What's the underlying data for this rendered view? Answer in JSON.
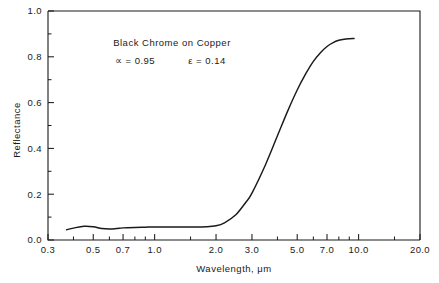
{
  "chart_data": {
    "type": "line",
    "title": "",
    "xlabel": "Wavelength, μm",
    "ylabel": "Reflectance",
    "xscale": "log",
    "yscale": "linear",
    "xlim": [
      0.3,
      20.0
    ],
    "ylim": [
      0.0,
      1.0
    ],
    "grid": false,
    "legend": "none",
    "x_ticks": [
      {
        "value": 0.3,
        "label": "0.3"
      },
      {
        "value": 0.5,
        "label": "0.5"
      },
      {
        "value": 0.7,
        "label": "0.7"
      },
      {
        "value": 1.0,
        "label": "1.0"
      },
      {
        "value": 2.0,
        "label": "2.0"
      },
      {
        "value": 3.0,
        "label": "3.0"
      },
      {
        "value": 5.0,
        "label": "5.0"
      },
      {
        "value": 7.0,
        "label": "7.0"
      },
      {
        "value": 10.0,
        "label": "10.0"
      },
      {
        "value": 20.0,
        "label": "20.0"
      }
    ],
    "x_minor_ticks": [
      0.4,
      0.6,
      0.8,
      0.9,
      1.5,
      4.0,
      6.0,
      8.0,
      9.0,
      15.0
    ],
    "y_ticks": [
      {
        "value": 0.0,
        "label": "0.0"
      },
      {
        "value": 0.2,
        "label": "0.2"
      },
      {
        "value": 0.4,
        "label": "0.4"
      },
      {
        "value": 0.6,
        "label": "0.6"
      },
      {
        "value": 0.8,
        "label": "0.8"
      },
      {
        "value": 1.0,
        "label": "1.0"
      }
    ],
    "y_minor_ticks": [
      0.1,
      0.3,
      0.5,
      0.7,
      0.9
    ],
    "series": [
      {
        "name": "Black Chrome on Copper reflectance",
        "color": "#1a1a1a",
        "x": [
          0.37,
          0.4,
          0.45,
          0.5,
          0.55,
          0.6,
          0.65,
          0.7,
          0.8,
          0.9,
          1.0,
          1.2,
          1.5,
          1.8,
          2.0,
          2.2,
          2.5,
          2.8,
          3.0,
          3.5,
          4.0,
          4.5,
          5.0,
          5.5,
          6.0,
          6.5,
          7.0,
          7.5,
          8.0,
          8.5,
          9.0,
          9.5
        ],
        "y": [
          0.045,
          0.052,
          0.06,
          0.058,
          0.05,
          0.048,
          0.05,
          0.053,
          0.055,
          0.056,
          0.057,
          0.057,
          0.057,
          0.058,
          0.062,
          0.075,
          0.11,
          0.165,
          0.205,
          0.33,
          0.455,
          0.565,
          0.655,
          0.725,
          0.78,
          0.818,
          0.845,
          0.862,
          0.872,
          0.877,
          0.879,
          0.88
        ]
      }
    ],
    "annotations": [
      {
        "name": "sample-label",
        "text": "Black Chrome on Copper",
        "x_px": 172,
        "y_px": 46
      },
      {
        "name": "absorptance-label",
        "text": "∝ = 0.95",
        "x_px": 135,
        "y_px": 64
      },
      {
        "name": "emittance-label",
        "text": "ε = 0.14",
        "x_px": 207,
        "y_px": 64
      }
    ]
  },
  "figure": {
    "background_color": "#ffffff",
    "axis_color": "#1a1a1a",
    "curve_color": "#1a1a1a"
  }
}
